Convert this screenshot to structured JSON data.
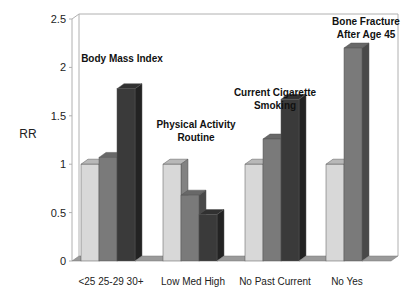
{
  "chart_data": {
    "type": "bar",
    "title": "",
    "xlabel": "",
    "ylabel": "RR",
    "ylim": [
      0,
      2.5
    ],
    "yticks": [
      "0",
      "0.5",
      "1",
      "1.5",
      "2",
      "2.5"
    ],
    "grid": false,
    "style": "3d-column",
    "groups": [
      {
        "title_lines": [
          "Body Mass Index"
        ],
        "categories": [
          "<25",
          "25-29",
          "30+"
        ],
        "values": [
          1.0,
          1.07,
          1.78
        ]
      },
      {
        "title_lines": [
          "Physical Activity",
          "Routine"
        ],
        "categories": [
          "Low",
          "Med",
          "High"
        ],
        "values": [
          1.0,
          0.68,
          0.48
        ]
      },
      {
        "title_lines": [
          "Current Cigarette",
          "Smoking"
        ],
        "categories": [
          "No",
          "Past",
          "Current"
        ],
        "values": [
          1.0,
          1.26,
          1.67
        ]
      },
      {
        "title_lines": [
          "Bone Fracture",
          "After Age 45"
        ],
        "categories": [
          "No",
          "Yes"
        ],
        "values": [
          1.0,
          2.2
        ]
      }
    ]
  },
  "colors": {
    "level1": "#d8d8d8",
    "level2": "#7a7a7a",
    "level3": "#3a3a3a",
    "floor": "#9a9a9a",
    "frame": "#b0b0b0"
  }
}
